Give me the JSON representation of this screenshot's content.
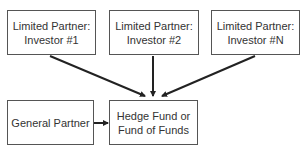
{
  "diagram": {
    "nodes": [
      {
        "id": "lp1",
        "line1": "Limited Partner:",
        "line2": "Investor #1"
      },
      {
        "id": "lp2",
        "line1": "Limited Partner:",
        "line2": "Investor #2"
      },
      {
        "id": "lpn",
        "line1": "Limited Partner:",
        "line2": "Investor #N"
      },
      {
        "id": "gp",
        "line1": "General Partner",
        "line2": ""
      },
      {
        "id": "fund",
        "line1": "Hedge Fund or",
        "line2": "Fund of Funds"
      }
    ],
    "edges": [
      {
        "from": "lp1",
        "to": "fund"
      },
      {
        "from": "lp2",
        "to": "fund"
      },
      {
        "from": "lpn",
        "to": "fund"
      },
      {
        "from": "gp",
        "to": "fund"
      }
    ]
  }
}
